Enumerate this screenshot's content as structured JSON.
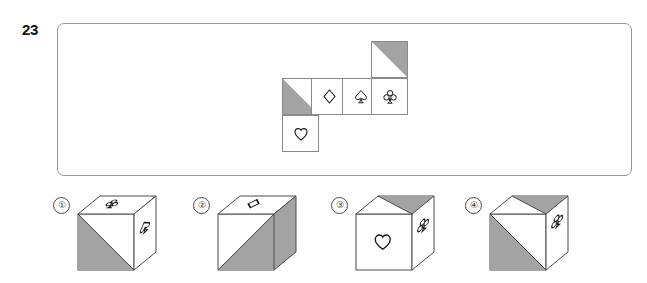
{
  "question": {
    "number": "23",
    "type": "cube-net-folding"
  },
  "colors": {
    "shade_fill": "#a3a3a3",
    "line": "#8a8a8a",
    "panel_border": "#999999",
    "glyph": "#1a1a1a",
    "background": "#ffffff"
  },
  "stimulus": {
    "name": "unfolded-cube-net",
    "cells": [
      {
        "id": "net-cell-1",
        "row": 1,
        "col": 1,
        "symbol": "none",
        "symbol_char": "",
        "shading": "lower-left-triangle"
      },
      {
        "id": "net-cell-2",
        "row": 1,
        "col": 2,
        "symbol": "diamond",
        "symbol_char": "♢",
        "shading": "none"
      },
      {
        "id": "net-cell-3",
        "row": 1,
        "col": 3,
        "symbol": "spade",
        "symbol_char": "♤",
        "shading": "none"
      },
      {
        "id": "net-cell-4",
        "row": 1,
        "col": 4,
        "symbol": "club",
        "symbol_char": "♧",
        "shading": "none"
      },
      {
        "id": "net-cell-5",
        "row": 0,
        "col": 4,
        "symbol": "none",
        "symbol_char": "",
        "shading": "upper-right-triangle"
      },
      {
        "id": "net-cell-6",
        "row": 2,
        "col": 1,
        "symbol": "heart",
        "symbol_char": "♡",
        "shading": "none"
      }
    ]
  },
  "options": [
    {
      "name": "option-1",
      "label": "①",
      "top_face": {
        "symbol": "club",
        "symbol_char": "♧",
        "shading": "none"
      },
      "front_face": {
        "symbol": "none",
        "symbol_char": "",
        "shading": "lower-left-triangle"
      },
      "right_face": {
        "symbol": "spade",
        "symbol_char": "♤",
        "shading": "none"
      }
    },
    {
      "name": "option-2",
      "label": "②",
      "top_face": {
        "symbol": "diamond",
        "symbol_char": "♢",
        "shading": "none"
      },
      "front_face": {
        "symbol": "none",
        "symbol_char": "",
        "shading": "lower-right-triangle"
      },
      "right_face": {
        "symbol": "none",
        "symbol_char": "",
        "shading": "full"
      }
    },
    {
      "name": "option-3",
      "label": "③",
      "top_face": {
        "symbol": "none",
        "symbol_char": "",
        "shading": "right-triangle"
      },
      "front_face": {
        "symbol": "heart",
        "symbol_char": "♡",
        "shading": "none"
      },
      "right_face": {
        "symbol": "club",
        "symbol_char": "♧",
        "shading": "none"
      }
    },
    {
      "name": "option-4",
      "label": "④",
      "top_face": {
        "symbol": "none",
        "symbol_char": "",
        "shading": "right-triangle"
      },
      "front_face": {
        "symbol": "none",
        "symbol_char": "",
        "shading": "upper-left-triangle"
      },
      "right_face": {
        "symbol": "club",
        "symbol_char": "♧",
        "shading": "none"
      }
    }
  ]
}
